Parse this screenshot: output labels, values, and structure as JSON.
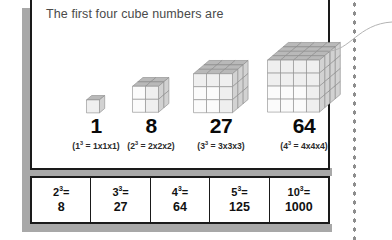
{
  "panel": {
    "heading": "The first four cube numbers are"
  },
  "cubes": [
    {
      "name": "cube-1",
      "n": 1,
      "size": 1,
      "value": "1",
      "base": "1",
      "exponent": "3",
      "expansion": "= 1x1x1"
    },
    {
      "name": "cube-2",
      "n": 2,
      "size": 2,
      "value": "8",
      "base": "2",
      "exponent": "3",
      "expansion": "= 2x2x2"
    },
    {
      "name": "cube-3",
      "n": 3,
      "size": 3,
      "value": "27",
      "base": "3",
      "exponent": "3",
      "expansion": "= 3x3x3"
    },
    {
      "name": "cube-4",
      "n": 4,
      "size": 4,
      "value": "64",
      "base": "4",
      "exponent": "3",
      "expansion": "= 4x4x4"
    }
  ],
  "table": {
    "cells": [
      {
        "base": "2",
        "exponent": "3",
        "equals": "=",
        "value": "8"
      },
      {
        "base": "3",
        "exponent": "3",
        "equals": "=",
        "value": "27"
      },
      {
        "base": "4",
        "exponent": "3",
        "equals": "=",
        "value": "64"
      },
      {
        "base": "5",
        "exponent": "3",
        "equals": "=",
        "value": "125"
      },
      {
        "base": "10",
        "exponent": "3",
        "equals": "=",
        "value": "1000"
      }
    ]
  },
  "colors": {
    "panel_border": "#1a1a1a",
    "shadow": "#a8a8a8",
    "heading_text": "#4a4a4a",
    "cube_top": "#b9b9b9",
    "cube_front": "#efefef",
    "cube_side": "#d2d2d2",
    "cube_stroke": "#8a8a8a",
    "dots": "#8d8d8d"
  }
}
